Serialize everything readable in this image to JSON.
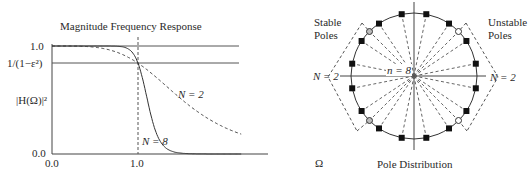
{
  "left_plot": {
    "title": "Magnitude Frequency Response",
    "ylabel": "|H(Ω)|²",
    "y_ticks": [
      {
        "label": "1.0",
        "value": 1.0
      },
      {
        "label": "1/(1−ε²)",
        "value": 0.84
      },
      {
        "label": "0.0",
        "value": 0.0
      }
    ],
    "x_ticks": [
      {
        "label": "0.0",
        "value": 0.0
      },
      {
        "label": "1.0",
        "value": 1.0
      }
    ],
    "xlabel": "Ω",
    "curve_labels": {
      "n2": "N = 2",
      "n8": "N = 8"
    }
  },
  "right_plot": {
    "title": "Pole Distribution",
    "stable_label_1": "Stable",
    "stable_label_2": "Poles",
    "unstable_label_1": "Unstable",
    "unstable_label_2": "Poles",
    "n_left": "N = 2",
    "n_right": "N = 2",
    "n_center": "n = 8"
  },
  "chart_data": [
    {
      "type": "line",
      "title": "Magnitude Frequency Response",
      "xlabel": "Ω",
      "ylabel": "|H(Ω)|²",
      "xlim": [
        0,
        2.2
      ],
      "ylim": [
        0,
        1.0
      ],
      "reference_lines": [
        {
          "y": 1.0,
          "label": "1.0"
        },
        {
          "y": 0.84,
          "label": "1/(1−ε²)"
        },
        {
          "x": 1.0,
          "style": "dashed"
        }
      ],
      "series": [
        {
          "name": "N = 2",
          "style": "dashed",
          "order": 2,
          "epsilon": 0.435
        },
        {
          "name": "N = 8",
          "style": "solid",
          "order": 8,
          "epsilon": 0.435
        }
      ]
    },
    {
      "type": "scatter",
      "title": "Pole Distribution",
      "description": "Butterworth poles on unit circle in s-plane",
      "series": [
        {
          "name": "n = 8 poles (2N = 16)",
          "marker": "square",
          "angles_deg": [
            11.25,
            33.75,
            56.25,
            78.75,
            101.25,
            123.75,
            146.25,
            168.75,
            191.25,
            213.75,
            236.25,
            258.75,
            281.25,
            303.75,
            326.25,
            348.75
          ]
        },
        {
          "name": "N = 2 poles",
          "marker": "circle",
          "angles_deg": [
            45,
            135,
            225,
            315
          ]
        }
      ],
      "annotations": [
        "Stable Poles",
        "Unstable Poles",
        "N = 2",
        "n = 8"
      ]
    }
  ],
  "colors": {
    "line": "#333333",
    "axis": "#555555",
    "dash": "#555555"
  }
}
